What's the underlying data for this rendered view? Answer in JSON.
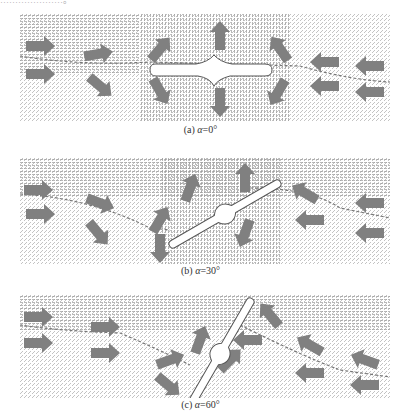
{
  "figure": {
    "top_fragment": "…………………。",
    "panels": [
      {
        "id": "a",
        "caption_prefix": "(a) ",
        "caption_var": "α",
        "caption_value": "=0°",
        "angle_deg": 0
      },
      {
        "id": "b",
        "caption_prefix": "(b) ",
        "caption_var": "α",
        "caption_value": "=30°",
        "angle_deg": 30
      },
      {
        "id": "c",
        "caption_prefix": "(c) ",
        "caption_var": "α",
        "caption_value": "=60°",
        "angle_deg": 60
      }
    ],
    "colors": {
      "vector_field": "#9a9a9a",
      "arrows": "#808080",
      "body": "#ffffff",
      "outline": "#555555",
      "dashed_line": "#777777"
    }
  }
}
